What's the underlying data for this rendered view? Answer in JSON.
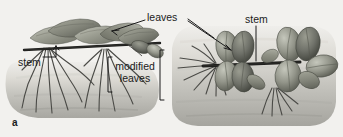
{
  "figure": {
    "panel_label": "a",
    "background_color": "#f2f1ee",
    "ink_color": "#1b1b1b",
    "type": "grayscale botanical illustration"
  },
  "labels": {
    "leaves": "leaves",
    "stem_left": "stem",
    "stem_right": "stem",
    "modified_leaves": "modified\nleaves",
    "modified_leaves_line1": "modified",
    "modified_leaves_line2": "leaves"
  },
  "annotations": {
    "leaves_leader_left": "pointer from 'leaves' to flat leaf on left plant",
    "leaves_leader_right": "pointer from 'leaves' to leaf on right plant",
    "stem_left_leader": "bracket pointer from 'stem' up-right to horizontal stem of left plant",
    "stem_right_leader": "vertical line from 'stem' down to horizontal stem of right plant",
    "modified_leaves_bracket_left": "square bracket grouping left plant's modified leaves",
    "modified_leaves_bracket_right": "square bracket grouping right plant's modified leaves"
  },
  "plants": {
    "left": {
      "name": "rhizome with flat paddle-shaped leaves",
      "soil_mound": "elongated horizontal rounded mound",
      "root_clusters": 2,
      "leaf_shape": "flat, broad, paddle-like",
      "stem_orientation": "horizontal"
    },
    "right": {
      "name": "plant with modified fleshy bulb-like leaves",
      "soil_mound": "large rounded rectangular mound",
      "rosettes": 2,
      "leaf_shape": "thick, oval, fleshy, swollen",
      "stem_orientation": "horizontal"
    }
  },
  "palette": {
    "background": "#f2f1ee",
    "soil_light": "#e4e3df",
    "soil_mid": "#c9c8c2",
    "soil_dark": "#a9a8a2",
    "leaf_light": "#b9bbb0",
    "leaf_mid": "#9a9c90",
    "leaf_dark": "#6f7167",
    "leaf_darkest": "#4e5048",
    "stem": "#1f1f1d",
    "root": "#4a4a46",
    "text": "#1b1b1b"
  }
}
